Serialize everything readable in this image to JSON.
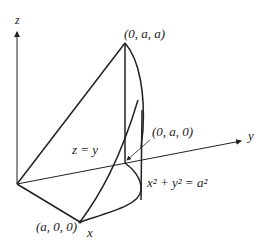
{
  "figure": {
    "type": "3d-solid-wedge",
    "axes": {
      "x_label": "x",
      "y_label": "y",
      "z_label": "z"
    },
    "points": {
      "top": "(0, a, a)",
      "mid": "(0, a, 0)",
      "x_intercept": "(a, 0, 0)"
    },
    "equations": {
      "plane": "z = y",
      "cylinder": "x² + y² = a²"
    },
    "colors": {
      "line": "#222222",
      "background": "#ffffff"
    }
  }
}
